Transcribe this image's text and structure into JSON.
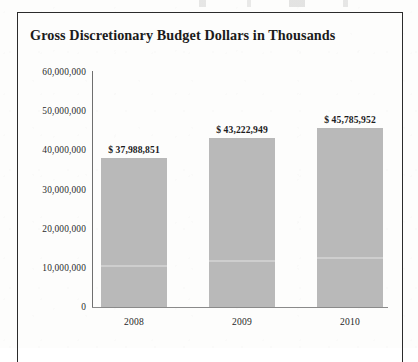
{
  "figure": {
    "title": "Gross Discretionary Budget Dollars in Thousands",
    "bar_color": "#b9b9b9",
    "frame_color": "#2b2b2b",
    "axis_color": "#8a8a8a",
    "text_color": "#1b1b1b"
  },
  "chart_data": {
    "type": "bar",
    "title": "Gross Discretionary Budget Dollars in Thousands",
    "xlabel": "",
    "ylabel": "",
    "categories": [
      "2008",
      "2009",
      "2010"
    ],
    "values": [
      37988851,
      43222949,
      45785952
    ],
    "data_labels": [
      "$ 37,988,851",
      "$ 43,222,949",
      "$ 45,785,952"
    ],
    "ylim": [
      0,
      60000000
    ],
    "ytick_values": [
      0,
      10000000,
      20000000,
      30000000,
      40000000,
      50000000,
      60000000
    ],
    "ytick_labels": [
      "0",
      "10,000,000",
      "20,000,000",
      "30,000,000",
      "40,000,000",
      "50,000,000",
      "60,000,000"
    ],
    "grid": false,
    "legend": false,
    "legend_position": "none",
    "series": [
      {
        "name": "Gross Discretionary Budget",
        "values": [
          37988851,
          43222949,
          45785952
        ]
      }
    ]
  }
}
